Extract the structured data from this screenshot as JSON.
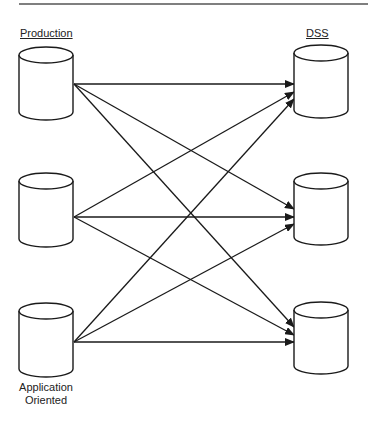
{
  "diagram": {
    "type": "many-to-many data flow",
    "left_column": {
      "header": "Production",
      "footer_line1": "Application",
      "footer_line2": "Oriented",
      "nodes": [
        {
          "id": "prod-1",
          "shape": "cylinder"
        },
        {
          "id": "prod-2",
          "shape": "cylinder"
        },
        {
          "id": "prod-3",
          "shape": "cylinder"
        }
      ]
    },
    "right_column": {
      "header": "DSS",
      "nodes": [
        {
          "id": "dss-1",
          "shape": "cylinder"
        },
        {
          "id": "dss-2",
          "shape": "cylinder"
        },
        {
          "id": "dss-3",
          "shape": "cylinder"
        }
      ]
    },
    "edges": [
      {
        "from": "prod-1",
        "to": "dss-1"
      },
      {
        "from": "prod-1",
        "to": "dss-2"
      },
      {
        "from": "prod-1",
        "to": "dss-3"
      },
      {
        "from": "prod-2",
        "to": "dss-1"
      },
      {
        "from": "prod-2",
        "to": "dss-2"
      },
      {
        "from": "prod-2",
        "to": "dss-3"
      },
      {
        "from": "prod-3",
        "to": "dss-1"
      },
      {
        "from": "prod-3",
        "to": "dss-2"
      },
      {
        "from": "prod-3",
        "to": "dss-3"
      }
    ],
    "colors": {
      "stroke": "#1a1a1a",
      "background": "#ffffff"
    }
  }
}
